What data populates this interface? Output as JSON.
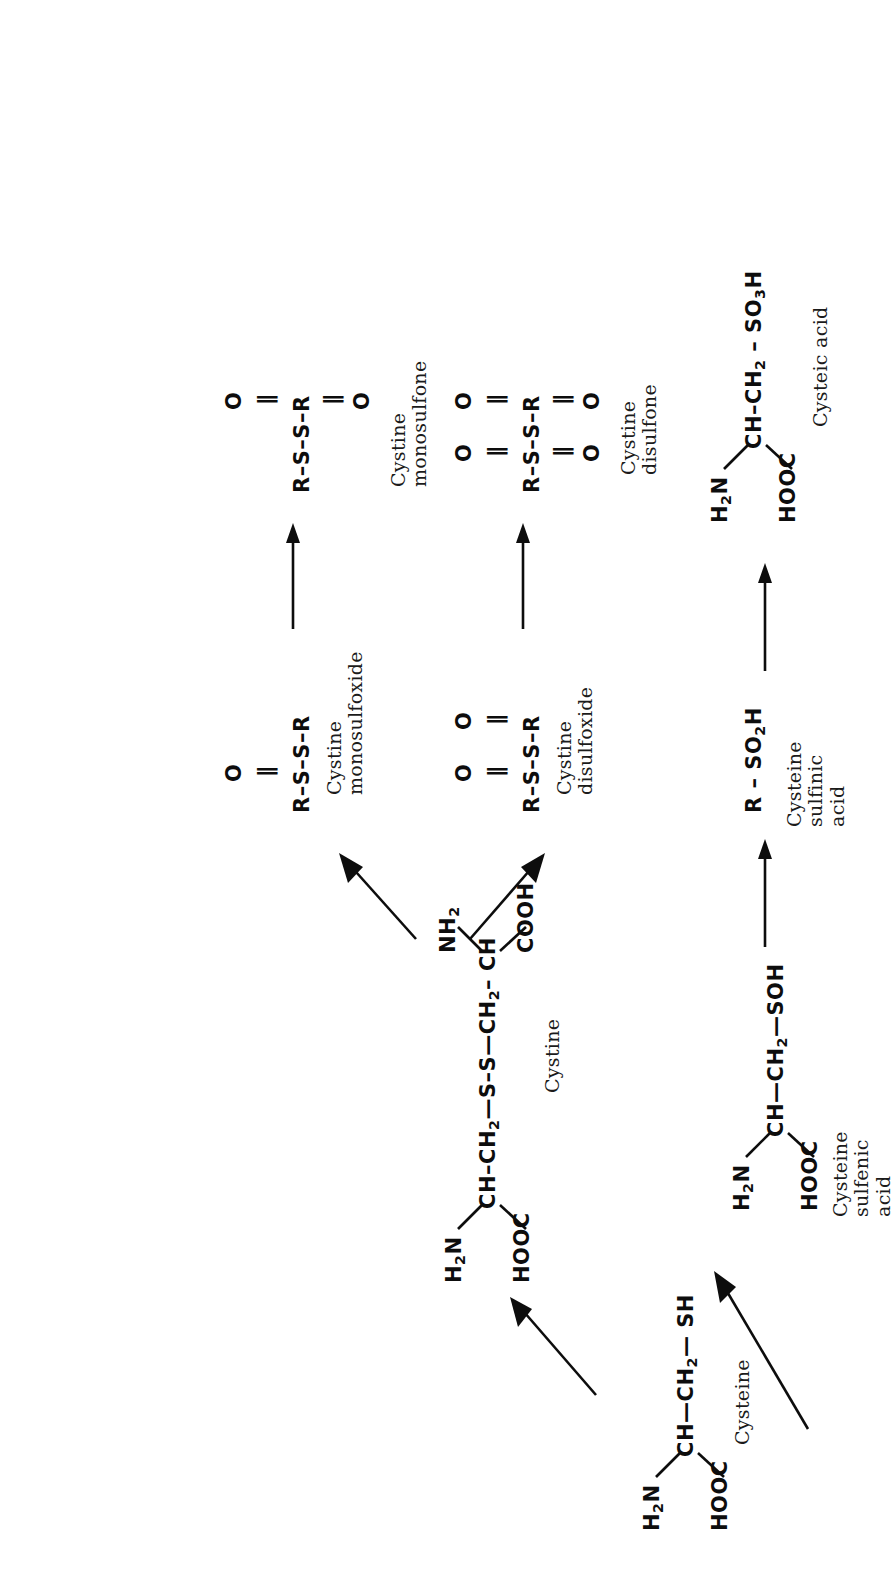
{
  "figure": {
    "kind": "hand-drawn chemical reaction scheme",
    "orientation_note": "page rendered rotated 90 degrees counter-clockwise"
  },
  "species": {
    "cysteine": {
      "label": "Cysteine",
      "formula_main": "CH—CH₂— SH",
      "amine": "H₂N",
      "acid": "HOOC"
    },
    "cystine": {
      "label": "Cystine",
      "formula_main": "CH—CH₂—S—S—CH₂— CH",
      "amine_left": "H₂N",
      "acid_left": "HOOC",
      "amine_right": "NH₂",
      "acid_right": "COOH"
    },
    "cystine_monosulfoxide": {
      "label": "Cystine\nmonosulfoxide",
      "backbone": "R—S—S—R",
      "oxygens": [
        "O"
      ]
    },
    "cystine_monosulfone": {
      "label": "Cystine monosulfone",
      "backbone": "R—S—S—R",
      "oxygens": [
        "O",
        "O"
      ]
    },
    "cystine_disulfoxide": {
      "label": "Cystine\ndisulfoxide",
      "backbone": "R—S—S—R",
      "oxygens": [
        "O",
        "O"
      ]
    },
    "cystine_disulfone": {
      "label": "Cystine\ndisulfone",
      "backbone": "R—S—S—R",
      "oxygens": [
        "O",
        "O",
        "O",
        "O"
      ]
    },
    "cysteine_sulfenic_acid": {
      "label": "Cysteine sulfenic\nacid",
      "formula_main": "CH—CH₂—SOH",
      "amine": "H₂N",
      "acid": "HOOC"
    },
    "cysteine_sulfinic_acid": {
      "label": "Cysteine\nsulfinic acid",
      "formula_main": "R – SO₂H"
    },
    "cysteic_acid": {
      "label": "Cysteic acid",
      "formula_main": "CH—CH₂ — SO₃H",
      "amine": "H₂N",
      "acid": "HOOC"
    }
  },
  "glyphs": {
    "R": "R",
    "S": "S",
    "O": "O",
    "double_bond": "=",
    "single_bond": "—",
    "long_arrow": "⟶"
  },
  "arrows": [
    {
      "name": "cysteine-to-cystine",
      "from": "Cysteine",
      "to": "Cystine"
    },
    {
      "name": "cysteine-to-cysteine-sulfenic-acid",
      "from": "Cysteine",
      "to": "Cysteine sulfenic acid"
    },
    {
      "name": "cystine-to-cystine-monosulfoxide",
      "from": "Cystine",
      "to": "Cystine monosulfoxide"
    },
    {
      "name": "cystine-to-cystine-disulfoxide",
      "from": "Cystine",
      "to": "Cystine disulfoxide"
    },
    {
      "name": "monosulfoxide-to-monosulfone",
      "from": "Cystine monosulfoxide",
      "to": "Cystine monosulfone"
    },
    {
      "name": "disulfoxide-to-disulfone",
      "from": "Cystine disulfoxide",
      "to": "Cystine disulfone"
    },
    {
      "name": "sulfenic-to-sulfinic",
      "from": "Cysteine sulfenic acid",
      "to": "Cysteine sulfinic acid"
    },
    {
      "name": "sulfinic-to-cysteic",
      "from": "Cysteine sulfinic acid",
      "to": "Cysteic acid"
    }
  ],
  "colors": {
    "ink": "#0d0d0d",
    "paper": "#ffffff"
  }
}
